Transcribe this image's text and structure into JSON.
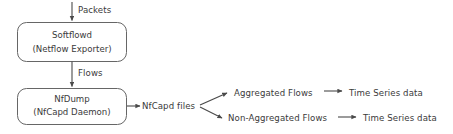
{
  "diagram": {
    "background_color": "#ffffff",
    "stroke_color": "#555555",
    "text_color": "#3a3a3a",
    "nodes": [
      {
        "id": "softflowd",
        "shape": "rounded-rectangle",
        "line1": "Softflowd",
        "line2": "(Netflow Exporter)"
      },
      {
        "id": "nfdump",
        "shape": "rounded-rectangle",
        "line1": "NfDump",
        "line2": "(NfCapd Daemon)"
      }
    ],
    "edge_labels": {
      "packets": "Packets",
      "flows": "Flows"
    },
    "text_nodes": {
      "nfcapd_files": "NfCapd files",
      "aggregated_flows": "Aggregated Flows",
      "non_aggregated_flows": "Non-Aggregated Flows",
      "time_series_top": "Time Series data",
      "time_series_bottom": "Time Series data"
    }
  }
}
